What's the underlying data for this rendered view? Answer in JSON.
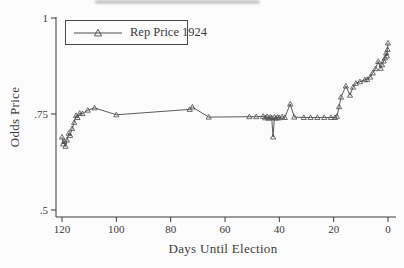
{
  "figure": {
    "background": "#fcfcfc",
    "line_color": "#4a4a4a",
    "text_color": "#3b3b3b"
  },
  "chart_data": {
    "type": "line",
    "title": "",
    "xlabel": "Days Until Election",
    "ylabel": "Odds Price",
    "grid": "off",
    "x_axis": {
      "min": 0,
      "max": 120,
      "reversed": true,
      "ticks": [
        120,
        100,
        80,
        60,
        40,
        20,
        0
      ]
    },
    "y_axis": {
      "min": 0.5,
      "max": 1.0,
      "ticks": [
        {
          "value": 1.0,
          "label": "1"
        },
        {
          "value": 0.75,
          "label": ".75"
        },
        {
          "value": 0.5,
          "label": ".5"
        }
      ]
    },
    "legend": {
      "position": "top-left",
      "entries": [
        {
          "label": "Rep Price 1924",
          "marker": "open-triangle"
        }
      ]
    },
    "series": [
      {
        "name": "Rep Price 1924",
        "marker": "open-triangle",
        "points": [
          [
            120,
            0.69
          ],
          [
            119.6,
            0.672
          ],
          [
            119.2,
            0.678
          ],
          [
            118.7,
            0.666
          ],
          [
            118.2,
            0.682
          ],
          [
            117.5,
            0.7
          ],
          [
            117.0,
            0.694
          ],
          [
            116.3,
            0.712
          ],
          [
            115.5,
            0.728
          ],
          [
            114.8,
            0.746
          ],
          [
            114.3,
            0.741
          ],
          [
            113.5,
            0.752
          ],
          [
            112.5,
            0.751
          ],
          [
            110.5,
            0.76
          ],
          [
            108,
            0.766
          ],
          [
            100,
            0.748
          ],
          [
            73,
            0.762
          ],
          [
            72,
            0.768
          ],
          [
            66,
            0.742
          ],
          [
            51,
            0.743
          ],
          [
            48.5,
            0.743
          ],
          [
            46,
            0.744
          ],
          [
            45.2,
            0.74
          ],
          [
            44.5,
            0.743
          ],
          [
            43.9,
            0.739
          ],
          [
            43.3,
            0.742
          ],
          [
            42.8,
            0.74
          ],
          [
            42.3,
            0.69
          ],
          [
            41.8,
            0.742
          ],
          [
            41.2,
            0.739
          ],
          [
            40.6,
            0.742
          ],
          [
            40,
            0.74
          ],
          [
            39,
            0.743
          ],
          [
            38,
            0.741
          ],
          [
            36,
            0.776
          ],
          [
            34.5,
            0.742
          ],
          [
            31,
            0.741
          ],
          [
            28.5,
            0.741
          ],
          [
            26,
            0.741
          ],
          [
            23.5,
            0.741
          ],
          [
            21,
            0.741
          ],
          [
            19.5,
            0.741
          ],
          [
            18.8,
            0.744
          ],
          [
            18,
            0.769
          ],
          [
            17.3,
            0.794
          ],
          [
            15.5,
            0.823
          ],
          [
            14,
            0.799
          ],
          [
            12.9,
            0.82
          ],
          [
            11.8,
            0.83
          ],
          [
            10.3,
            0.834
          ],
          [
            8.5,
            0.839
          ],
          [
            7.7,
            0.84
          ],
          [
            6.6,
            0.846
          ],
          [
            5.6,
            0.857
          ],
          [
            4.6,
            0.868
          ],
          [
            3.6,
            0.887
          ],
          [
            2.7,
            0.869
          ],
          [
            2.2,
            0.878
          ],
          [
            1.6,
            0.888
          ],
          [
            1.1,
            0.896
          ],
          [
            0.7,
            0.909
          ],
          [
            0.4,
            0.901
          ],
          [
            0.2,
            0.918
          ],
          [
            0,
            0.935
          ]
        ]
      }
    ]
  }
}
